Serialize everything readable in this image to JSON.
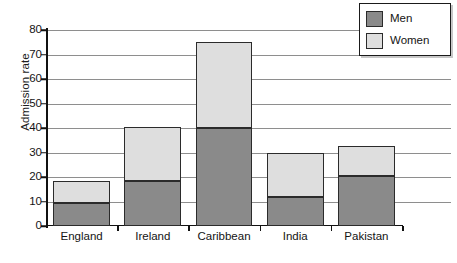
{
  "chart_data": {
    "type": "bar",
    "subtype": "stacked-vertical",
    "title": "",
    "xlabel": "",
    "ylabel": "Admission rate",
    "categories": [
      "England",
      "Ireland",
      "Caribbean",
      "India",
      "Pakistan"
    ],
    "series": [
      {
        "name": "Men",
        "color": "#8a8a8a",
        "values": [
          9.5,
          18.5,
          40,
          12,
          20.5
        ]
      },
      {
        "name": "Women",
        "color": "#dedede",
        "values": [
          9,
          22,
          35,
          18,
          12
        ]
      }
    ],
    "totals": [
      18.5,
      40.5,
      75,
      30,
      32.5
    ],
    "ylim": [
      0,
      80
    ],
    "yticks": [
      0,
      10,
      20,
      30,
      40,
      50,
      60,
      70,
      80
    ],
    "ytick_labels": [
      "0",
      "10",
      "20",
      "30",
      "40",
      "50",
      "60",
      "70",
      "80"
    ],
    "grid": true,
    "grid_axis": "y",
    "legend_position": "top-right",
    "legend_entries": [
      "Men",
      "Women"
    ]
  }
}
